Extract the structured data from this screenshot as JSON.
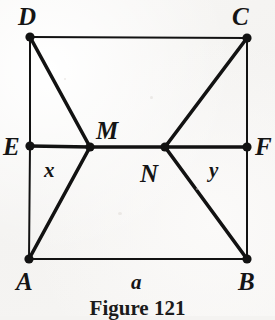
{
  "figure": {
    "caption": "Figure 121",
    "background_color": "#f4f3f1",
    "ink_color": "#121212",
    "vertices": [
      {
        "id": "D",
        "label": "D",
        "x": 30,
        "y": 37,
        "label_x": 18,
        "label_y": 4,
        "size": "cap"
      },
      {
        "id": "C",
        "label": "C",
        "x": 247,
        "y": 38,
        "label_x": 232,
        "label_y": 4,
        "size": "cap"
      },
      {
        "id": "E",
        "label": "E",
        "x": 30,
        "y": 146,
        "label_x": 3,
        "label_y": 134,
        "size": "cap"
      },
      {
        "id": "F",
        "label": "F",
        "x": 247,
        "y": 147,
        "label_x": 255,
        "label_y": 134,
        "size": "cap"
      },
      {
        "id": "M",
        "label": "M",
        "x": 90,
        "y": 147,
        "label_x": 96,
        "label_y": 118,
        "size": "cap"
      },
      {
        "id": "N",
        "label": "N",
        "x": 165,
        "y": 147,
        "label_x": 140,
        "label_y": 161,
        "size": "cap"
      },
      {
        "id": "A",
        "label": "A",
        "x": 29,
        "y": 259,
        "label_x": 16,
        "label_y": 269,
        "size": "cap"
      },
      {
        "id": "B",
        "label": "B",
        "x": 247,
        "y": 259,
        "label_x": 238,
        "label_y": 269,
        "size": "cap"
      }
    ],
    "segments": [
      {
        "name": "side-DC",
        "from": "D",
        "to": "C",
        "weight": "thin"
      },
      {
        "name": "side-DE",
        "from": "D",
        "to": "E",
        "weight": "thin"
      },
      {
        "name": "side-EA",
        "from": "E",
        "to": "A",
        "weight": "thin"
      },
      {
        "name": "side-CF",
        "from": "C",
        "to": "F",
        "weight": "thin"
      },
      {
        "name": "side-FB",
        "from": "F",
        "to": "B",
        "weight": "thin"
      },
      {
        "name": "side-AB",
        "from": "A",
        "to": "B",
        "weight": "thin"
      },
      {
        "name": "midline-EM",
        "from": "E",
        "to": "M",
        "weight": "thick"
      },
      {
        "name": "midline-MN",
        "from": "M",
        "to": "N",
        "weight": "thick"
      },
      {
        "name": "midline-NF",
        "from": "N",
        "to": "F",
        "weight": "thick"
      },
      {
        "name": "diagonal-DM",
        "from": "D",
        "to": "M",
        "weight": "thick"
      },
      {
        "name": "diagonal-MA",
        "from": "M",
        "to": "A",
        "weight": "thick"
      },
      {
        "name": "diagonal-CN",
        "from": "C",
        "to": "N",
        "weight": "thick"
      },
      {
        "name": "diagonal-NB",
        "from": "N",
        "to": "B",
        "weight": "thick"
      }
    ],
    "measure_labels": [
      {
        "id": "x",
        "label": "x",
        "x": 44,
        "y": 160,
        "size": "small"
      },
      {
        "id": "y",
        "label": "y",
        "x": 209,
        "y": 160,
        "size": "small"
      },
      {
        "id": "a",
        "label": "a",
        "x": 131,
        "y": 272,
        "size": "small"
      }
    ],
    "caption_y": 298
  }
}
